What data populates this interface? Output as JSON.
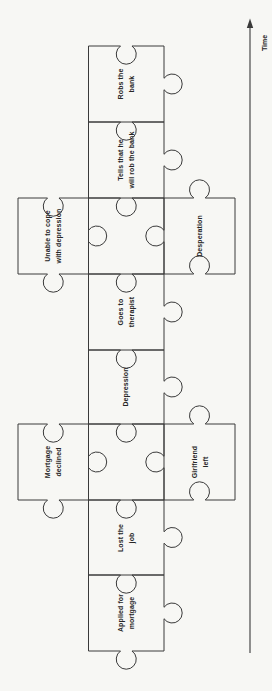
{
  "colors": {
    "ink": "#3a3a3a",
    "paper": "#f7f7f4",
    "text": "#262626"
  },
  "timeline": {
    "label": "Time",
    "direction": "up"
  },
  "pieces": [
    {
      "id": "robs-the-bank",
      "label": "Robs the\nbank",
      "column": "center",
      "row": 0,
      "edges": {
        "top": "in",
        "right": "out",
        "bottom": "flat",
        "left": "flat"
      }
    },
    {
      "id": "tells-that-he-will-rob-the-bank",
      "label": "Tells that he\nwill rob the bank",
      "column": "center",
      "row": 1,
      "edges": {
        "top": "in",
        "right": "out",
        "bottom": "flat",
        "left": "flat"
      }
    },
    {
      "id": "unable-to-cope-with-depression",
      "label": "Unable to cope\nwith depression",
      "column": "left",
      "row": 2,
      "edges": {
        "top": "in",
        "right": "out",
        "bottom": "out",
        "left": "flat"
      }
    },
    {
      "id": "connector-upper",
      "label": "",
      "column": "center",
      "row": 2,
      "edges": {
        "top": "in",
        "right": "flat",
        "bottom": "flat",
        "left": "flat"
      }
    },
    {
      "id": "desperation",
      "label": "Desperation",
      "column": "right",
      "row": 2,
      "edges": {
        "top": "out",
        "right": "flat",
        "bottom": "in",
        "left": "out"
      }
    },
    {
      "id": "goes-to-therapist",
      "label": "Goes to\ntherapist",
      "column": "center",
      "row": 3,
      "edges": {
        "top": "in",
        "right": "out",
        "bottom": "flat",
        "left": "flat"
      }
    },
    {
      "id": "depression",
      "label": "Depression",
      "column": "center",
      "row": 4,
      "edges": {
        "top": "in",
        "right": "out",
        "bottom": "flat",
        "left": "flat"
      }
    },
    {
      "id": "mortgage-declined",
      "label": "Mortgage\ndeclined",
      "column": "left",
      "row": 5,
      "edges": {
        "top": "in",
        "right": "out",
        "bottom": "out",
        "left": "flat"
      }
    },
    {
      "id": "connector-lower",
      "label": "",
      "column": "center",
      "row": 5,
      "edges": {
        "top": "in",
        "right": "flat",
        "bottom": "flat",
        "left": "flat"
      }
    },
    {
      "id": "girlfriend-left",
      "label": "Girlfriend\nleft",
      "column": "right",
      "row": 5,
      "edges": {
        "top": "out",
        "right": "flat",
        "bottom": "in",
        "left": "out"
      }
    },
    {
      "id": "lost-the-job",
      "label": "Lost the\njob",
      "column": "center",
      "row": 6,
      "edges": {
        "top": "in",
        "right": "out",
        "bottom": "flat",
        "left": "flat"
      }
    },
    {
      "id": "applied-for-mortgage",
      "label": "Applied for\nmortgage",
      "column": "center",
      "row": 7,
      "edges": {
        "top": "in",
        "right": "out",
        "bottom": "out",
        "left": "flat"
      }
    }
  ]
}
